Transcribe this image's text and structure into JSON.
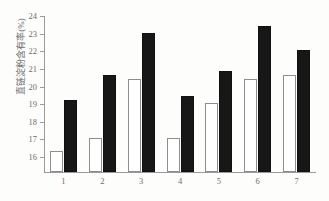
{
  "chart_data": {
    "type": "bar",
    "title": "",
    "xlabel": "",
    "ylabel": "直链淀粉含有率(%)",
    "categories": [
      "1",
      "2",
      "3",
      "4",
      "5",
      "6",
      "7"
    ],
    "ylim": [
      15.1,
      24
    ],
    "yticks": [
      16,
      17,
      18,
      19,
      20,
      21,
      22,
      23,
      24
    ],
    "grid": false,
    "legend": "none",
    "series": [
      {
        "name": "open-bar",
        "style": "white-filled-with-black-outline",
        "color": "#ffffff",
        "values": [
          16.3,
          17.0,
          20.4,
          17.0,
          19.0,
          20.4,
          20.6
        ]
      },
      {
        "name": "filled-bar",
        "style": "solid-black",
        "color": "#171717",
        "values": [
          19.2,
          20.6,
          23.0,
          19.4,
          20.8,
          23.4,
          22.0
        ]
      }
    ]
  },
  "axes": {
    "y_axis_title": "直链淀粉含有率(%)",
    "y_tick_labels": [
      "24",
      "23",
      "22",
      "21",
      "20",
      "19",
      "18",
      "17",
      "16"
    ],
    "x_tick_labels": [
      "1",
      "2",
      "3",
      "4",
      "5",
      "6",
      "7"
    ]
  },
  "colors": {
    "axis": "#9a9a9a",
    "text": "#6d6d6d",
    "bar_open_fill": "#ffffff",
    "bar_open_stroke": "#8d8d8d",
    "bar_filled": "#171717",
    "background": "#fdfdfc"
  }
}
